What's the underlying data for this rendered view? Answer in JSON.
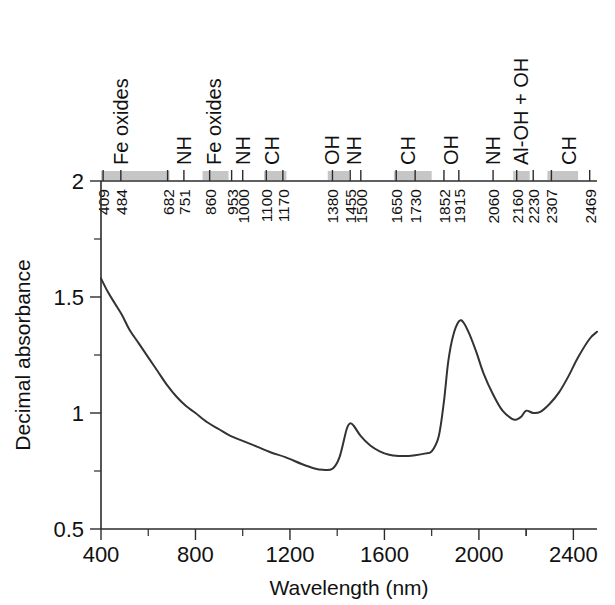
{
  "chart_data": {
    "type": "line",
    "title": "",
    "xlabel": "Wavelength (nm)",
    "ylabel": "Decimal absorbance",
    "xlim": [
      400,
      2500
    ],
    "ylim": [
      0.5,
      2.0
    ],
    "xticks": [
      400,
      800,
      1200,
      1600,
      2000,
      2400
    ],
    "xticklabels": [
      "400",
      "800",
      "1200",
      "1600",
      "2000",
      "2400"
    ],
    "yticks": [
      0.5,
      1,
      1.5,
      2
    ],
    "yticklabels": [
      "0.5",
      "1",
      "1.5",
      "2"
    ],
    "yminorticks": [
      0.75,
      1.25,
      1.75
    ],
    "grid": false,
    "legend": null,
    "series": [
      {
        "name": "soil reflectance spectrum",
        "x": [
          400,
          430,
          460,
          490,
          520,
          560,
          600,
          640,
          680,
          720,
          760,
          800,
          850,
          900,
          950,
          1000,
          1060,
          1120,
          1180,
          1250,
          1300,
          1340,
          1380,
          1410,
          1440,
          1455,
          1470,
          1500,
          1540,
          1580,
          1620,
          1660,
          1700,
          1730,
          1770,
          1800,
          1830,
          1852,
          1870,
          1890,
          1915,
          1935,
          1960,
          1990,
          2020,
          2060,
          2100,
          2140,
          2160,
          2180,
          2200,
          2230,
          2260,
          2300,
          2340,
          2380,
          2420,
          2469,
          2500
        ],
        "y": [
          1.58,
          1.52,
          1.47,
          1.42,
          1.36,
          1.3,
          1.24,
          1.18,
          1.12,
          1.07,
          1.03,
          1.0,
          0.96,
          0.93,
          0.9,
          0.88,
          0.855,
          0.83,
          0.81,
          0.78,
          0.762,
          0.755,
          0.76,
          0.81,
          0.93,
          0.955,
          0.945,
          0.9,
          0.86,
          0.835,
          0.82,
          0.815,
          0.815,
          0.818,
          0.825,
          0.835,
          0.9,
          1.05,
          1.22,
          1.33,
          1.395,
          1.39,
          1.34,
          1.26,
          1.17,
          1.08,
          1.01,
          0.975,
          0.972,
          0.985,
          1.01,
          1.0,
          1.005,
          1.04,
          1.09,
          1.16,
          1.24,
          1.32,
          1.35
        ]
      }
    ],
    "top_axis": {
      "label": "absorption feature assignments",
      "features": [
        {
          "wavelength": 409,
          "tick_label": "409",
          "assignment": "",
          "band": true,
          "band_from": 400,
          "band_to": 690
        },
        {
          "wavelength": 484,
          "tick_label": "484",
          "assignment": "Fe oxides",
          "band": false
        },
        {
          "wavelength": 682,
          "tick_label": "682",
          "assignment": "",
          "band": false
        },
        {
          "wavelength": 751,
          "tick_label": "751",
          "assignment": "NH",
          "band": false
        },
        {
          "wavelength": 860,
          "tick_label": "860",
          "assignment": "Fe oxides",
          "band": true,
          "band_from": 830,
          "band_to": 940
        },
        {
          "wavelength": 953,
          "tick_label": "953",
          "assignment": "",
          "band": false
        },
        {
          "wavelength": 1000,
          "tick_label": "1000",
          "assignment": "NH",
          "band": false
        },
        {
          "wavelength": 1100,
          "tick_label": "1100",
          "assignment": "",
          "band": true,
          "band_from": 1090,
          "band_to": 1185
        },
        {
          "wavelength": 1170,
          "tick_label": "1170",
          "assignment": "CH",
          "band": false
        },
        {
          "wavelength": 1380,
          "tick_label": "1380",
          "assignment": "OH",
          "band": true,
          "band_from": 1360,
          "band_to": 1450
        },
        {
          "wavelength": 1455,
          "tick_label": "1455",
          "assignment": "",
          "band": false
        },
        {
          "wavelength": 1500,
          "tick_label": "1500",
          "assignment": "NH",
          "band": false
        },
        {
          "wavelength": 1650,
          "tick_label": "1650",
          "assignment": "CH",
          "band": true,
          "band_from": 1640,
          "band_to": 1800
        },
        {
          "wavelength": 1730,
          "tick_label": "1730",
          "assignment": "",
          "band": false
        },
        {
          "wavelength": 1852,
          "tick_label": "1852",
          "assignment": "OH",
          "band": false
        },
        {
          "wavelength": 1915,
          "tick_label": "1915",
          "assignment": "",
          "band": false
        },
        {
          "wavelength": 2060,
          "tick_label": "2060",
          "assignment": "NH",
          "band": false
        },
        {
          "wavelength": 2160,
          "tick_label": "2160",
          "assignment": "Al-OH + OH",
          "band": true,
          "band_from": 2145,
          "band_to": 2215
        },
        {
          "wavelength": 2230,
          "tick_label": "2230",
          "assignment": "",
          "band": false
        },
        {
          "wavelength": 2307,
          "tick_label": "2307",
          "assignment": "",
          "band": true,
          "band_from": 2290,
          "band_to": 2420
        },
        {
          "wavelength": 2469,
          "tick_label": "2469",
          "assignment": "CH",
          "band": false
        }
      ],
      "assignment_labels": [
        {
          "text": "Fe oxides",
          "at": 484
        },
        {
          "text": "NH",
          "at": 751
        },
        {
          "text": "Fe oxides",
          "at": 880
        },
        {
          "text": "NH",
          "at": 1000
        },
        {
          "text": "CH",
          "at": 1125
        },
        {
          "text": "OH",
          "at": 1380
        },
        {
          "text": "NH",
          "at": 1470
        },
        {
          "text": "CH",
          "at": 1700
        },
        {
          "text": "OH",
          "at": 1880
        },
        {
          "text": "NH",
          "at": 2060
        },
        {
          "text": "Al-OH + OH",
          "at": 2180
        },
        {
          "text": "CH",
          "at": 2380
        }
      ]
    },
    "colors": {
      "curve": "#333333",
      "axis": "#2b2b2b",
      "band": "#c6c6c6",
      "text": "#111111",
      "background": "#ffffff"
    }
  }
}
